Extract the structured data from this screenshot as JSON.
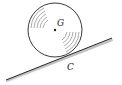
{
  "diagram": {
    "labels": {
      "center": "G",
      "contact": "C"
    },
    "colors": {
      "stroke": "#222222",
      "background": "#ffffff"
    }
  }
}
